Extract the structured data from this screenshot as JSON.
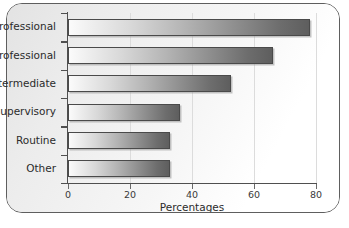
{
  "chart_data": {
    "type": "bar",
    "orientation": "horizontal",
    "title": "",
    "xlabel": "Percentages",
    "ylabel": "",
    "xlim": [
      0,
      80
    ],
    "xticks": [
      0,
      20,
      40,
      60,
      80
    ],
    "xtick_labels": [
      "0",
      "20",
      "40",
      "60",
      "80"
    ],
    "grid": true,
    "legend": null,
    "categories": [
      "r professional",
      "r professional",
      "Intermediate",
      "er supervisory",
      "Routine",
      "Other"
    ],
    "values": [
      78,
      66,
      52.5,
      36,
      33,
      33
    ],
    "series": [
      {
        "name": "Percentages",
        "values": [
          78,
          66,
          52.5,
          36,
          33,
          33
        ]
      }
    ],
    "bar_fill": "gradient-light-to-dark-gray",
    "bar_border_color": "#4a4a4a",
    "axis_color": "#4f4f4f",
    "frame_color": "#5e5e5e",
    "background": "#ffffff"
  },
  "axis": {
    "x_title": "Percentages"
  }
}
